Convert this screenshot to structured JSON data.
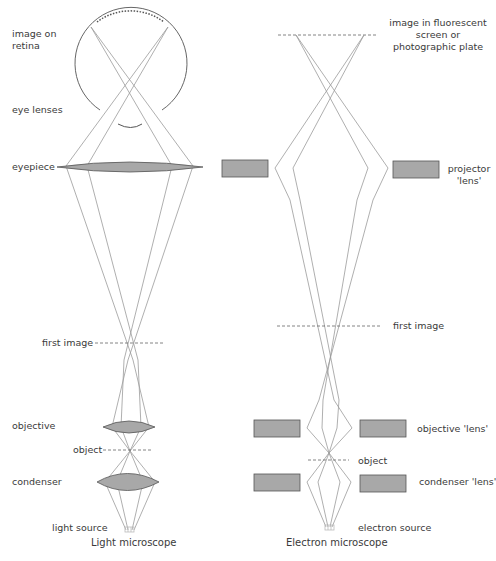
{
  "diagram": {
    "light_microscope": {
      "title": "Light microscope",
      "labels": {
        "image_on_retina": "image on\nretina",
        "eye_lenses": "eye lenses",
        "eyepiece": "eyepiece",
        "first_image": "first image",
        "objective": "objective",
        "object": "object",
        "condenser": "condenser",
        "light_source": "light source"
      }
    },
    "electron_microscope": {
      "title": "Electron microscope",
      "labels": {
        "image_screen": "image in fluorescent\nscreen or\nphotographic plate",
        "projector_lens": "projector\n'lens'",
        "first_image": "first image",
        "objective_lens": "objective 'lens'",
        "object": "object",
        "condenser_lens": "condenser 'lens'",
        "electron_source": "electron source"
      }
    },
    "colors": {
      "ray": "#9a9a9a",
      "lens_fill": "#a8a8a8",
      "lens_stroke": "#555555",
      "dashed": "#666666",
      "text": "#3a3a3a"
    }
  }
}
